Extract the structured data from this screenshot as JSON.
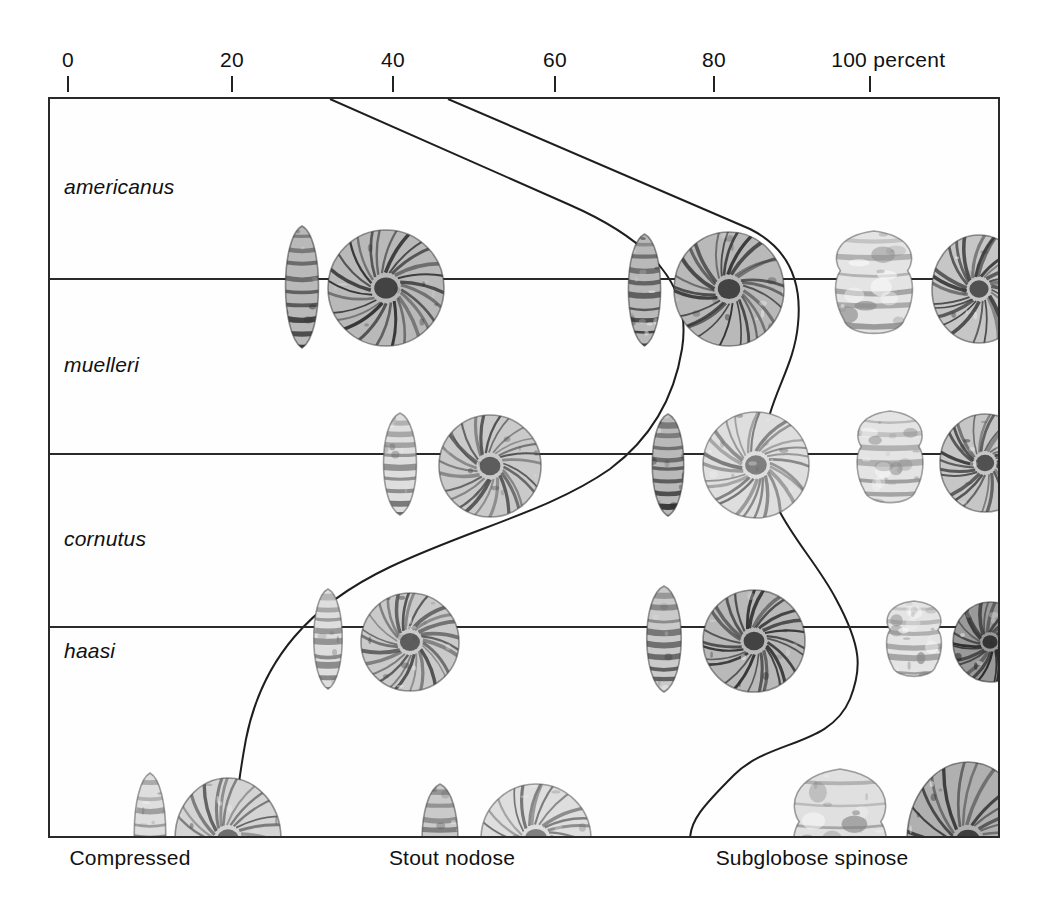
{
  "figure": {
    "axis_unit_label": "100 percent",
    "x_axis": {
      "ticks": [
        {
          "value": 0,
          "label": "0",
          "x": 68
        },
        {
          "value": 20,
          "label": "20",
          "x": 232
        },
        {
          "value": 40,
          "label": "40",
          "x": 393
        },
        {
          "value": 60,
          "label": "60",
          "x": 555
        },
        {
          "value": 80,
          "label": "80",
          "x": 714
        },
        {
          "value": 100,
          "label": "100 percent",
          "x": 870
        }
      ],
      "range": [
        0,
        100
      ]
    },
    "zones": [
      {
        "name": "Compressed",
        "label": "Compressed",
        "center_x": 130
      },
      {
        "name": "Stout nodose",
        "label": "Stout nodose",
        "center_x": 452
      },
      {
        "name": "Subglobose spinose",
        "label": "Subglobose spinose",
        "center_x": 812
      }
    ],
    "rows": [
      {
        "species": "americanus",
        "label": "americanus",
        "top": 0,
        "height": 180,
        "label_valign": "middle"
      },
      {
        "species": "muelleri",
        "label": "muelleri",
        "top": 180,
        "height": 175,
        "label_valign": "middle"
      },
      {
        "species": "cornutus",
        "label": "cornutus",
        "top": 355,
        "height": 173,
        "label_valign": "middle"
      },
      {
        "species": "haasi",
        "label": "haasi",
        "top": 528,
        "height": 211,
        "label_valign": "top"
      }
    ],
    "boundary_curves": [
      {
        "name": "compressed-stout-boundary",
        "path": "M 280 0 L 520 106 C 620 150 640 200 632 250 C 624 300 600 340 560 370 C 500 412 420 430 340 468 C 260 506 212 560 196 640 C 185 700 185 720 190 741"
      },
      {
        "name": "stout-subglobose-boundary",
        "path": "M 398 0 L 700 130 C 740 150 752 185 748 225 C 744 272 716 300 714 350 C 712 412 760 450 786 500 C 812 548 812 570 800 600 C 780 648 720 640 684 676 C 652 708 640 722 640 741"
      }
    ],
    "specimen_count": 24,
    "specimens": [
      {
        "row": "americanus",
        "type": "lateral",
        "x": 252,
        "y": 188,
        "w": 46,
        "h": 124,
        "tone": "dark-ribbed"
      },
      {
        "row": "americanus",
        "type": "coiled",
        "x": 336,
        "y": 189,
        "w": 118,
        "h": 118,
        "tone": "dark-ribbed"
      },
      {
        "row": "americanus",
        "type": "lateral",
        "x": 594,
        "y": 191,
        "w": 45,
        "h": 114,
        "tone": "dark-ribbed"
      },
      {
        "row": "americanus",
        "type": "coiled",
        "x": 679,
        "y": 190,
        "w": 112,
        "h": 116,
        "tone": "dark-ribbed"
      },
      {
        "row": "americanus",
        "type": "nodose",
        "x": 824,
        "y": 188,
        "w": 86,
        "h": 116,
        "tone": "light-nodose"
      },
      {
        "row": "americanus",
        "type": "coiled",
        "x": 929,
        "y": 190,
        "w": 96,
        "h": 110,
        "tone": "mid-nodose"
      },
      {
        "row": "muelleri",
        "type": "lateral",
        "x": 350,
        "y": 365,
        "w": 46,
        "h": 104,
        "tone": "light-ribbed"
      },
      {
        "row": "muelleri",
        "type": "coiled",
        "x": 440,
        "y": 367,
        "w": 104,
        "h": 104,
        "tone": "mid-ribbed"
      },
      {
        "row": "muelleri",
        "type": "lateral",
        "x": 618,
        "y": 366,
        "w": 44,
        "h": 104,
        "tone": "dark-ribbed"
      },
      {
        "row": "muelleri",
        "type": "coiled",
        "x": 706,
        "y": 366,
        "w": 108,
        "h": 108,
        "tone": "light-ribbed"
      },
      {
        "row": "muelleri",
        "type": "nodose",
        "x": 840,
        "y": 362,
        "w": 74,
        "h": 104,
        "tone": "light-nodose"
      },
      {
        "row": "muelleri",
        "type": "coiled",
        "x": 935,
        "y": 364,
        "w": 92,
        "h": 100,
        "tone": "mid-nodose"
      },
      {
        "row": "cornutus",
        "type": "lateral",
        "x": 278,
        "y": 540,
        "w": 40,
        "h": 102,
        "tone": "light-ribbed"
      },
      {
        "row": "cornutus",
        "type": "coiled",
        "x": 360,
        "y": 543,
        "w": 100,
        "h": 100,
        "tone": "mid-ribbed"
      },
      {
        "row": "cornutus",
        "type": "lateral",
        "x": 614,
        "y": 540,
        "w": 48,
        "h": 108,
        "tone": "mid-ribbed"
      },
      {
        "row": "cornutus",
        "type": "coiled",
        "x": 704,
        "y": 542,
        "w": 104,
        "h": 104,
        "tone": "dark-ribbed"
      },
      {
        "row": "cornutus",
        "type": "nodose",
        "x": 864,
        "y": 543,
        "w": 62,
        "h": 86,
        "tone": "light-nodose"
      },
      {
        "row": "cornutus",
        "type": "coiled",
        "x": 940,
        "y": 543,
        "w": 76,
        "h": 82,
        "tone": "dark-nodose"
      },
      {
        "row": "haasi",
        "type": "lateral",
        "x": 100,
        "y": 735,
        "w": 44,
        "h": 124,
        "tone": "light-ribbed"
      },
      {
        "row": "haasi",
        "type": "coiled",
        "x": 178,
        "y": 740,
        "w": 108,
        "h": 124,
        "tone": "mottled"
      },
      {
        "row": "haasi",
        "type": "lateral",
        "x": 390,
        "y": 742,
        "w": 50,
        "h": 116,
        "tone": "mid-ribbed"
      },
      {
        "row": "haasi",
        "type": "coiled",
        "x": 486,
        "y": 740,
        "w": 112,
        "h": 112,
        "tone": "light-ribbed"
      },
      {
        "row": "haasi",
        "type": "nodose",
        "x": 790,
        "y": 744,
        "w": 104,
        "h": 152,
        "tone": "big-nodose"
      },
      {
        "row": "haasi",
        "type": "coiled",
        "x": 918,
        "y": 742,
        "w": 124,
        "h": 160,
        "tone": "rugged"
      }
    ]
  }
}
